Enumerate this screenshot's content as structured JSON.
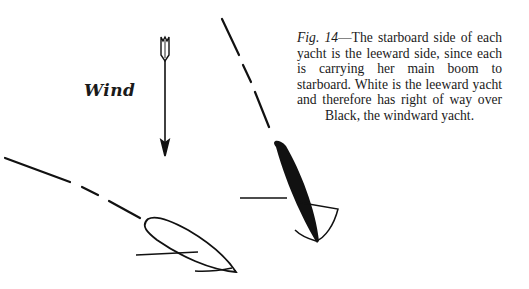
{
  "figure": {
    "wind_label": "Wind",
    "caption": {
      "figure_ref": "Fig. 14",
      "dash": "—",
      "text": "The starboard side of each yacht is the leeward side, since each is carrying her main boom to starboard. White is the leeward yacht and therefore has right of way over Black, the windward yacht."
    },
    "elements": {
      "wind_arrow": {
        "direction": "down"
      },
      "white_yacht": {
        "label": "White",
        "role": "leeward yacht",
        "fill": "#ffffff",
        "stroke": "#111111"
      },
      "black_yacht": {
        "label": "Black",
        "role": "windward yacht",
        "fill": "#111111"
      },
      "boom_side": "starboard"
    }
  }
}
